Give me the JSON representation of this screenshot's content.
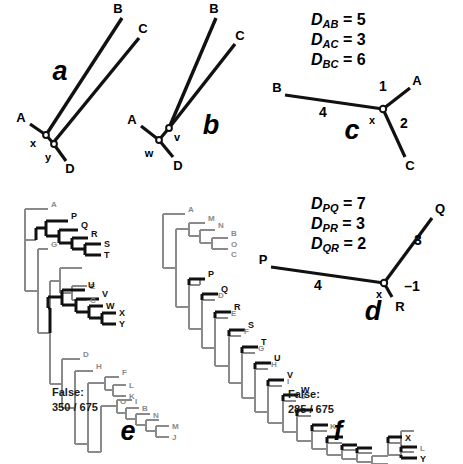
{
  "figure": {
    "panels": [
      "a",
      "b",
      "c",
      "d",
      "e",
      "f"
    ]
  },
  "panel_a": {
    "letter": "a",
    "tips": [
      "A",
      "B",
      "C",
      "D"
    ],
    "internal_nodes": [
      "x",
      "y"
    ],
    "description": "unrooted four-taxon tree, long B and C branches"
  },
  "panel_b": {
    "letter": "b",
    "tips": [
      "A",
      "B",
      "C",
      "D"
    ],
    "internal_nodes": [
      "v",
      "w"
    ],
    "description": "unrooted four-taxon tree, long B and C branches grouped"
  },
  "panel_c": {
    "letter": "c",
    "distances": [
      {
        "label": "D",
        "sub": "AB",
        "eq": "=",
        "value": "5"
      },
      {
        "label": "D",
        "sub": "AC",
        "eq": "=",
        "value": "3"
      },
      {
        "label": "D",
        "sub": "BC",
        "eq": "=",
        "value": "6"
      }
    ],
    "tips": [
      "A",
      "B",
      "C"
    ],
    "internal_node": "x",
    "branch_lengths": {
      "to_B": "4",
      "to_A": "1",
      "to_C": "2"
    }
  },
  "panel_d": {
    "letter": "d",
    "distances": [
      {
        "label": "D",
        "sub": "PQ",
        "eq": "=",
        "value": "7"
      },
      {
        "label": "D",
        "sub": "PR",
        "eq": "=",
        "value": "3"
      },
      {
        "label": "D",
        "sub": "QR",
        "eq": "=",
        "value": "2"
      }
    ],
    "tips": [
      "P",
      "Q",
      "R"
    ],
    "internal_node": "x",
    "branch_lengths": {
      "to_P": "4",
      "to_Q": "3",
      "to_R": "–1"
    }
  },
  "panel_e": {
    "letter": "e",
    "false_label": "False:",
    "false_value": "350 / 675",
    "taxa": [
      {
        "name": "A",
        "highlight": false
      },
      {
        "name": "P",
        "highlight": true
      },
      {
        "name": "Q",
        "highlight": true
      },
      {
        "name": "R",
        "highlight": true
      },
      {
        "name": "S",
        "highlight": true
      },
      {
        "name": "T",
        "highlight": true
      },
      {
        "name": "G",
        "highlight": false
      },
      {
        "name": "E",
        "highlight": false
      },
      {
        "name": "C",
        "highlight": false
      },
      {
        "name": "U",
        "highlight": true
      },
      {
        "name": "V",
        "highlight": true
      },
      {
        "name": "W",
        "highlight": true
      },
      {
        "name": "X",
        "highlight": true
      },
      {
        "name": "Y",
        "highlight": true
      },
      {
        "name": "D",
        "highlight": false
      },
      {
        "name": "H",
        "highlight": false
      },
      {
        "name": "F",
        "highlight": false
      },
      {
        "name": "L",
        "highlight": false
      },
      {
        "name": "K",
        "highlight": false
      },
      {
        "name": "O",
        "highlight": false
      },
      {
        "name": "I",
        "highlight": false
      },
      {
        "name": "B",
        "highlight": false
      },
      {
        "name": "N",
        "highlight": false
      },
      {
        "name": "M",
        "highlight": false
      },
      {
        "name": "J",
        "highlight": false
      }
    ]
  },
  "panel_f": {
    "letter": "f",
    "false_label": "False:",
    "false_value": "285 / 675",
    "taxa": [
      {
        "name": "A",
        "highlight": false
      },
      {
        "name": "M",
        "highlight": false
      },
      {
        "name": "N",
        "highlight": false
      },
      {
        "name": "B",
        "highlight": false
      },
      {
        "name": "O",
        "highlight": false
      },
      {
        "name": "C",
        "highlight": false
      },
      {
        "name": "P",
        "highlight": true
      },
      {
        "name": "D",
        "highlight": false
      },
      {
        "name": "Q",
        "highlight": true
      },
      {
        "name": "E",
        "highlight": false
      },
      {
        "name": "R",
        "highlight": true
      },
      {
        "name": "F",
        "highlight": false
      },
      {
        "name": "S",
        "highlight": true
      },
      {
        "name": "G",
        "highlight": false
      },
      {
        "name": "T",
        "highlight": true
      },
      {
        "name": "H",
        "highlight": false
      },
      {
        "name": "U",
        "highlight": true
      },
      {
        "name": "I",
        "highlight": false
      },
      {
        "name": "V",
        "highlight": true
      },
      {
        "name": "J",
        "highlight": false
      },
      {
        "name": "W",
        "highlight": true
      },
      {
        "name": "K",
        "highlight": false
      },
      {
        "name": "X",
        "highlight": true
      },
      {
        "name": "L",
        "highlight": false
      },
      {
        "name": "Y",
        "highlight": true
      }
    ]
  },
  "colors": {
    "black": "#111111",
    "grey": "#8a8a8a",
    "background": "#ffffff"
  }
}
